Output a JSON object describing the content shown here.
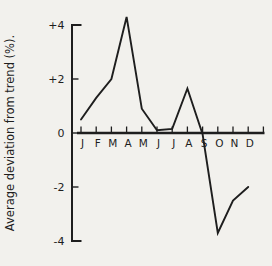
{
  "figure": {
    "background": "#f2f1ed",
    "ink": "#1e1e1e"
  },
  "chart_data": {
    "type": "line",
    "title": "",
    "xlabel": "",
    "ylabel": "Average deviation from trend (%).",
    "categories": [
      "J",
      "F",
      "M",
      "A",
      "M",
      "J",
      "J",
      "A",
      "S",
      "O",
      "N",
      "D"
    ],
    "series": [
      {
        "name": "Average deviation from trend",
        "values": [
          0.5,
          1.3,
          2.0,
          4.3,
          0.9,
          0.1,
          0.15,
          1.65,
          -0.05,
          -3.7,
          -2.5,
          -2.0
        ]
      }
    ],
    "y_ticks": [
      {
        "label": "+4",
        "value": 4
      },
      {
        "label": "+2",
        "value": 2
      },
      {
        "label": "0",
        "value": 0
      },
      {
        "label": "-2",
        "value": -2
      },
      {
        "label": "-4",
        "value": -4
      }
    ],
    "ylim": [
      -4,
      4
    ],
    "grid": false,
    "legend": "none"
  }
}
